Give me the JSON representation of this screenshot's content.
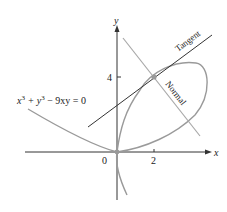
{
  "figure": {
    "equation": "x³ + y³ − 9xy = 0",
    "equation_parts": {
      "x": "x",
      "sup3a": "3",
      "plus_y": " + y",
      "sup3b": "3",
      "rest": " − 9xy = 0"
    },
    "axis_x_label": "x",
    "axis_y_label": "y",
    "origin_label": "0",
    "x_tick_label": "2",
    "y_tick_label": "4",
    "tangent_label": "Tangent",
    "normal_label": "Normal",
    "point": {
      "x": 2,
      "y": 4
    },
    "colors": {
      "curve": "#9a9a9a",
      "tangent": "#333333",
      "normal": "#a8a8a8",
      "axis": "#333333"
    }
  }
}
